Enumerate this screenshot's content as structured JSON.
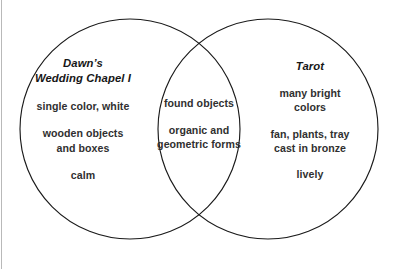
{
  "canvas": {
    "width": 396,
    "height": 269,
    "background_color": "#ffffff",
    "stroke_color": "#1a1a1a",
    "text_color": "#303030",
    "edge_rule_color": "#b9b9b9"
  },
  "diagram": {
    "type": "venn",
    "set_count": 2,
    "left_circle": {
      "cx": 130,
      "cy": 129,
      "r": 110
    },
    "right_circle": {
      "cx": 268,
      "cy": 129,
      "r": 110
    }
  },
  "left": {
    "title_lines": [
      "Dawn’s",
      "Wedding Chapel I"
    ],
    "items": [
      {
        "lines": [
          "single color, white"
        ]
      },
      {
        "lines": [
          "wooden objects",
          "and boxes"
        ]
      },
      {
        "lines": [
          "calm"
        ]
      }
    ]
  },
  "center": {
    "items": [
      {
        "lines": [
          "found objects"
        ]
      },
      {
        "lines": [
          "organic and",
          "geometric forms"
        ]
      }
    ]
  },
  "right": {
    "title_lines": [
      "Tarot"
    ],
    "items": [
      {
        "lines": [
          "many bright",
          "colors"
        ]
      },
      {
        "lines": [
          "fan, plants, tray",
          "cast in bronze"
        ]
      },
      {
        "lines": [
          "lively"
        ]
      }
    ]
  }
}
